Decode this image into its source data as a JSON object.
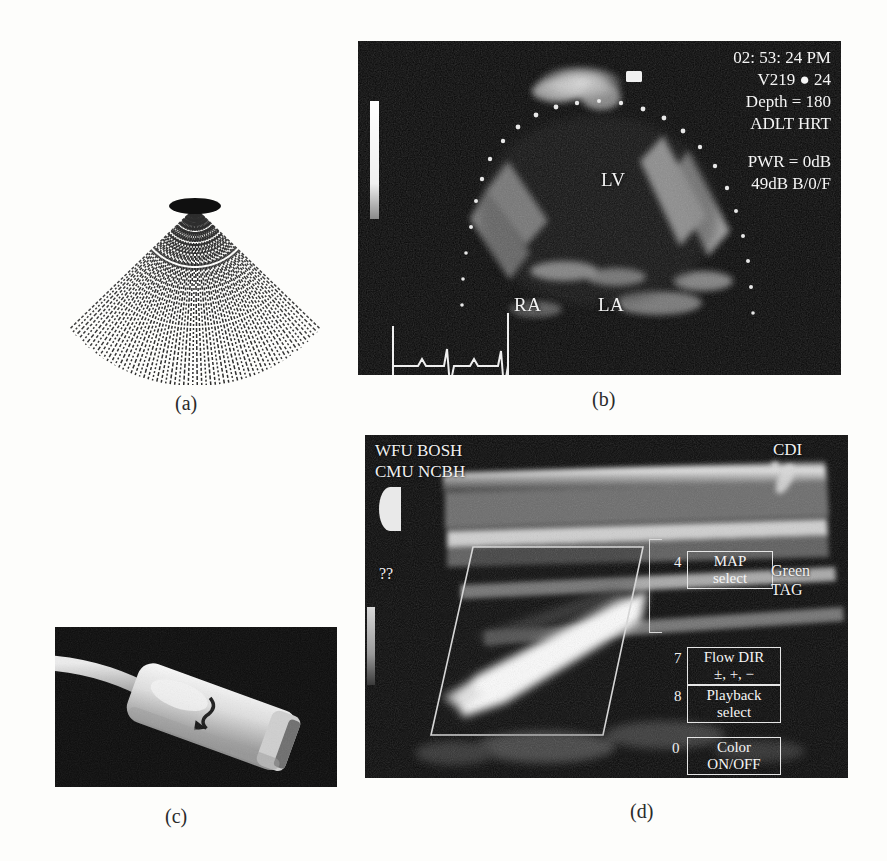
{
  "figure": {
    "captions": [
      {
        "id": "a",
        "label": "(a)"
      },
      {
        "id": "b",
        "label": "(b)"
      },
      {
        "id": "c",
        "label": "(c)"
      },
      {
        "id": "d",
        "label": "(d)"
      }
    ]
  },
  "panel_a": {
    "name": "sector-scan-line-diagram",
    "description": "fan of radial ultrasound scan lines converging at apex",
    "line_count": 64,
    "half_angle_deg": 46,
    "apex_x": 155,
    "apex_y": 18,
    "radius": 178
  },
  "panel_b": {
    "name": "echocardiogram-four-chamber-view",
    "overlay_lines": [
      "02: 53: 24 PM",
      "V219   ●   24",
      "Depth = 180",
      "ADLT HRT"
    ],
    "overlay_lines_2": [
      "PWR = 0dB",
      "49dB  B/0/F"
    ],
    "anatomy_labels": [
      {
        "text": "LV",
        "x": 243,
        "y": 128
      },
      {
        "text": "RA",
        "x": 156,
        "y": 253
      },
      {
        "text": "LA",
        "x": 240,
        "y": 253
      }
    ],
    "timestamp": "02: 53: 24 PM",
    "probe_id": "V219",
    "frame_number": "24",
    "depth": "Depth = 180",
    "preset": "ADLT HRT",
    "power": "PWR = 0dB",
    "gain": "49dB  B/0/F"
  },
  "panel_c": {
    "name": "linear-array-transducer-photograph",
    "description": "handheld ultrasound transducer probe with cable"
  },
  "panel_d": {
    "name": "color-doppler-vascular-image",
    "header_left": [
      "WFU    BOSH",
      "CMU   NCBH"
    ],
    "header_right": "CDI",
    "unknown_marker": "??",
    "side_label": [
      "Green",
      "TAG"
    ],
    "menu_items": [
      {
        "num": "4",
        "lines": [
          "MAP",
          "select"
        ]
      },
      {
        "num": "7",
        "lines": [
          "Flow DIR",
          "±, +, −"
        ]
      },
      {
        "num": "8",
        "lines": [
          "Playback",
          "select"
        ]
      },
      {
        "num": "0",
        "lines": [
          "Color",
          "ON/OFF"
        ]
      }
    ]
  }
}
